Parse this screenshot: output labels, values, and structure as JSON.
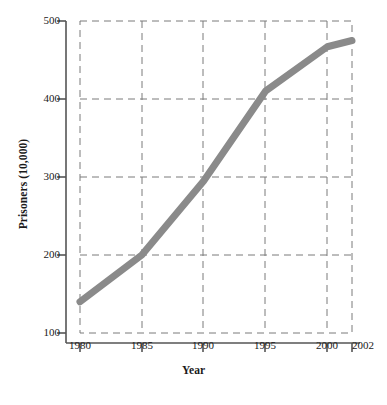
{
  "chart_data": {
    "type": "line",
    "title": "",
    "xlabel": "Year",
    "ylabel": "Prisoners (10,000)",
    "x": [
      1980,
      1985,
      1990,
      1995,
      2000,
      2002
    ],
    "values": [
      140,
      200,
      295,
      410,
      467,
      475
    ],
    "series": [
      {
        "name": "Prisoners",
        "color": "#8a8a8a",
        "values": [
          140,
          200,
          295,
          410,
          467,
          475
        ]
      }
    ],
    "xtick_labels": [
      "1980",
      "1985",
      "1990",
      "1995",
      "2000",
      "2002"
    ],
    "xticks": [
      1980,
      1985,
      1990,
      1995,
      2000,
      2002
    ],
    "ytick_labels": [
      "100",
      "200",
      "300",
      "400",
      "500"
    ],
    "yticks": [
      100,
      200,
      300,
      400,
      500
    ],
    "xlim": [
      1980,
      2002
    ],
    "ylim": [
      100,
      500
    ],
    "grid": true,
    "grid_style": "dashed",
    "grid_color": "#7a7a7a",
    "legend": "none",
    "line_width": 7,
    "axis_color": "#555555"
  },
  "caption": {
    "text": ""
  }
}
